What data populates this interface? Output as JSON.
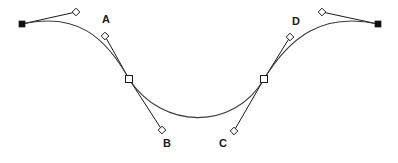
{
  "canvas": {
    "width": 398,
    "height": 163,
    "background": "#ffffff",
    "title": "Bezier curve control point editor"
  },
  "colors": {
    "curve_stroke": "#3b3b3b",
    "handle_stroke": "#1a1a1a",
    "anchor_fill": "#111111",
    "node_fill": "#ffffff",
    "label_color": "#1a1a1a"
  },
  "chart_data": {
    "type": "line",
    "title": "",
    "xlabel": "",
    "ylabel": "",
    "grid": false,
    "legend": "none",
    "curve": {
      "start": [
        22,
        24
      ],
      "segments": [
        {
          "c1": [
            76,
            12
          ],
          "c2": [
            105,
            36
          ],
          "end": [
            129,
            79
          ]
        },
        {
          "c1": [
            162,
            130
          ],
          "c2": [
            234,
            131
          ],
          "end": [
            264,
            79
          ]
        },
        {
          "c1": [
            290,
            37
          ],
          "c2": [
            322,
            12
          ],
          "end": [
            378,
            24
          ]
        }
      ],
      "path": "M 22 24 C 76 12 105 36 129 79 C 162 130 234 131 264 79 C 290 37 322 12 378 24"
    }
  },
  "geometry": {
    "anchors": [
      {
        "name": "anchor-start",
        "x": 22,
        "y": 24,
        "shape": "filled-square"
      },
      {
        "name": "node-left",
        "x": 129,
        "y": 79,
        "shape": "open-square"
      },
      {
        "name": "node-right",
        "x": 264,
        "y": 79,
        "shape": "open-square"
      },
      {
        "name": "anchor-end",
        "x": 378,
        "y": 24,
        "shape": "filled-square"
      }
    ],
    "handles": [
      {
        "name": "handle-start-out",
        "x": 76,
        "y": 12,
        "anchor": [
          22,
          24
        ],
        "label": ""
      },
      {
        "name": "handle-a",
        "x": 105,
        "y": 36,
        "anchor": [
          129,
          79
        ],
        "label": "A"
      },
      {
        "name": "handle-b",
        "x": 162,
        "y": 130,
        "anchor": [
          129,
          79
        ],
        "label": "B"
      },
      {
        "name": "handle-c",
        "x": 234,
        "y": 131,
        "anchor": [
          264,
          79
        ],
        "label": "C"
      },
      {
        "name": "handle-d",
        "x": 290,
        "y": 37,
        "anchor": [
          264,
          79
        ],
        "label": "D"
      },
      {
        "name": "handle-end-in",
        "x": 322,
        "y": 12,
        "anchor": [
          378,
          24
        ],
        "label": ""
      }
    ]
  },
  "labels": {
    "a": "A",
    "b": "B",
    "c": "C",
    "d": "D"
  }
}
